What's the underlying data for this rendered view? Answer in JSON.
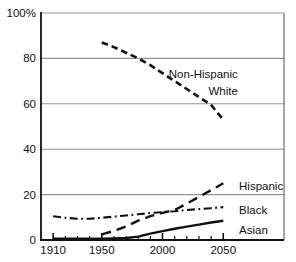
{
  "chart_data": {
    "type": "line",
    "title": "",
    "xlabel": "",
    "ylabel": "",
    "xlim": [
      1900,
      2100
    ],
    "ylim": [
      0,
      100
    ],
    "grid": "horizontal",
    "legend_position": "inline-annotations",
    "yticks": [
      0,
      20,
      40,
      60,
      80,
      100
    ],
    "ytick_labels": [
      "0",
      "20",
      "40",
      "60",
      "80",
      "100%"
    ],
    "xticks_minor": [
      1910,
      1920,
      1930,
      1940,
      1950,
      1960,
      1970,
      1980,
      1990,
      2000,
      2010,
      2020,
      2030,
      2040,
      2050
    ],
    "xticks_major": [
      1910,
      1950,
      2000,
      2050
    ],
    "xtick_labels": [
      "1910",
      "1950",
      "2000",
      "2050"
    ],
    "series": [
      {
        "name": "Non-Hispanic White",
        "style": "dashed",
        "x": [
          1950,
          1960,
          1970,
          1980,
          1990,
          2000,
          2010,
          2020,
          2030,
          2040,
          2050
        ],
        "values": [
          87,
          85,
          82.5,
          80,
          77,
          73.5,
          70,
          66.5,
          63,
          59.5,
          53
        ]
      },
      {
        "name": "Hispanic",
        "style": "long-dash",
        "x": [
          1950,
          1960,
          1970,
          1980,
          1990,
          2000,
          2010,
          2020,
          2030,
          2040,
          2050
        ],
        "values": [
          2.5,
          4,
          6,
          8.5,
          10.5,
          12,
          13.2,
          16,
          19,
          22,
          25
        ]
      },
      {
        "name": "Black",
        "style": "dash-dot",
        "x": [
          1910,
          1920,
          1930,
          1940,
          1950,
          1960,
          1970,
          1980,
          1990,
          2000,
          2010,
          2020,
          2030,
          2040,
          2050
        ],
        "values": [
          10.5,
          9.8,
          9.4,
          9.4,
          9.8,
          10.3,
          10.8,
          11.3,
          11.9,
          12.3,
          12.7,
          13.2,
          13.6,
          14,
          14.5
        ]
      },
      {
        "name": "Asian",
        "style": "solid",
        "x": [
          1910,
          1920,
          1930,
          1940,
          1950,
          1960,
          1970,
          1980,
          1990,
          2000,
          2010,
          2020,
          2030,
          2040,
          2050
        ],
        "values": [
          0.6,
          0.6,
          0.6,
          0.6,
          0.6,
          0.7,
          0.9,
          1.5,
          2.8,
          3.9,
          5,
          5.9,
          6.8,
          7.7,
          8.5
        ]
      }
    ],
    "annotations": [
      {
        "text": "Non-Hispanic",
        "year": 2062,
        "pct": 73,
        "anchor": "end"
      },
      {
        "text": "White",
        "year": 2062,
        "pct": 65.5,
        "anchor": "end"
      },
      {
        "text": "Hispanic",
        "year": 2063,
        "pct": 24,
        "anchor": "start"
      },
      {
        "text": "Black",
        "year": 2063,
        "pct": 13.4,
        "anchor": "start"
      },
      {
        "text": "Asian",
        "year": 2063,
        "pct": 4.6,
        "anchor": "start"
      }
    ],
    "colors": {
      "line": "#111111",
      "grid": "#949494",
      "right_border": "#6b6b6b",
      "axis": "#111111",
      "text": "#111111",
      "background": "#ffffff"
    }
  }
}
